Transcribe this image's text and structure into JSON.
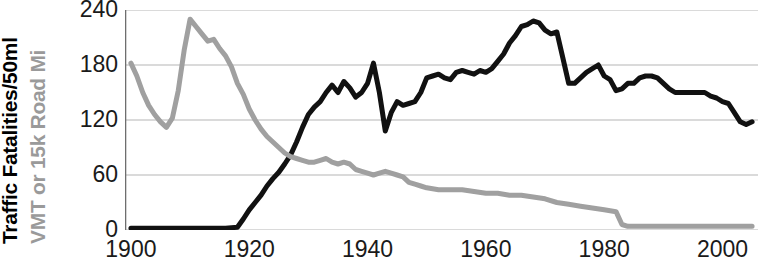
{
  "chart_data": {
    "type": "line",
    "title": "",
    "xlabel": "",
    "ylabel_primary": "Traffic Fatalities/50ml",
    "ylabel_secondary": "VMT or 15k Road Mi",
    "xlim": [
      1899,
      2006
    ],
    "ylim": [
      0,
      240
    ],
    "xticks": [
      1900,
      1920,
      1940,
      1960,
      1980,
      2000
    ],
    "xtick_labels": [
      "1900",
      "1920",
      "1940",
      "1960",
      "1980",
      "2000"
    ],
    "yticks": [
      0,
      60,
      120,
      180,
      240
    ],
    "ytick_labels": [
      "0",
      "60",
      "120",
      "180",
      "240"
    ],
    "grid": true,
    "grid_axis": "y",
    "legend": "none",
    "colors": {
      "series_black": "#111111",
      "series_gray": "#a0a0a0",
      "grid": "#b5b5b5",
      "axis": "#6e6e6e",
      "text": "#1a1a1a"
    },
    "series": [
      {
        "name": "Traffic Fatalities per 50 million VMT",
        "color": "#111111",
        "linewidth": 5,
        "x": [
          1900,
          1902,
          1904,
          1906,
          1908,
          1910,
          1912,
          1914,
          1916,
          1918,
          1919,
          1920,
          1921,
          1922,
          1923,
          1924,
          1925,
          1926,
          1927,
          1928,
          1929,
          1930,
          1931,
          1932,
          1933,
          1934,
          1935,
          1936,
          1937,
          1938,
          1939,
          1940,
          1941,
          1942,
          1943,
          1944,
          1945,
          1946,
          1947,
          1948,
          1949,
          1950,
          1951,
          1952,
          1953,
          1954,
          1955,
          1956,
          1957,
          1958,
          1959,
          1960,
          1961,
          1962,
          1963,
          1964,
          1965,
          1966,
          1967,
          1968,
          1969,
          1970,
          1971,
          1972,
          1973,
          1974,
          1975,
          1976,
          1977,
          1978,
          1979,
          1980,
          1981,
          1982,
          1983,
          1984,
          1985,
          1986,
          1987,
          1988,
          1989,
          1990,
          1991,
          1992,
          1993,
          1994,
          1995,
          1996,
          1997,
          1998,
          1999,
          2000,
          2001,
          2002,
          2003,
          2004,
          2005
        ],
        "values": [
          2,
          2,
          2,
          2,
          2,
          2,
          2,
          2,
          2,
          3,
          12,
          22,
          30,
          38,
          48,
          56,
          63,
          72,
          82,
          96,
          112,
          126,
          134,
          140,
          150,
          158,
          150,
          162,
          155,
          145,
          150,
          160,
          182,
          150,
          108,
          128,
          140,
          136,
          138,
          140,
          150,
          166,
          168,
          170,
          166,
          164,
          172,
          174,
          172,
          170,
          174,
          172,
          176,
          184,
          192,
          204,
          212,
          222,
          224,
          228,
          226,
          218,
          214,
          216,
          188,
          160,
          160,
          166,
          172,
          176,
          180,
          168,
          164,
          152,
          154,
          160,
          160,
          166,
          168,
          168,
          166,
          160,
          154,
          150,
          150,
          150,
          150,
          150,
          150,
          146,
          144,
          140,
          138,
          128,
          118,
          115,
          118
        ]
      },
      {
        "name": "VMT or 15k Road Miles",
        "color": "#a0a0a0",
        "linewidth": 5,
        "x": [
          1900,
          1901,
          1902,
          1903,
          1904,
          1905,
          1906,
          1907,
          1908,
          1909,
          1910,
          1911,
          1912,
          1913,
          1914,
          1915,
          1916,
          1917,
          1918,
          1919,
          1920,
          1921,
          1922,
          1923,
          1924,
          1925,
          1926,
          1927,
          1928,
          1929,
          1930,
          1931,
          1932,
          1933,
          1934,
          1935,
          1936,
          1937,
          1938,
          1939,
          1940,
          1941,
          1942,
          1943,
          1944,
          1945,
          1946,
          1947,
          1948,
          1949,
          1950,
          1952,
          1954,
          1956,
          1958,
          1960,
          1962,
          1964,
          1966,
          1968,
          1970,
          1972,
          1974,
          1976,
          1978,
          1980,
          1982,
          1983,
          1984,
          1986,
          1988,
          1990,
          1992,
          1994,
          1996,
          1998,
          2000,
          2002,
          2004,
          2005
        ],
        "values": [
          182,
          168,
          150,
          136,
          126,
          118,
          112,
          122,
          152,
          196,
          230,
          222,
          214,
          206,
          208,
          198,
          190,
          178,
          160,
          148,
          132,
          120,
          110,
          102,
          96,
          90,
          84,
          80,
          78,
          76,
          74,
          74,
          76,
          78,
          74,
          72,
          74,
          72,
          66,
          64,
          62,
          60,
          62,
          64,
          62,
          60,
          58,
          52,
          50,
          48,
          46,
          44,
          44,
          44,
          42,
          40,
          40,
          38,
          38,
          36,
          34,
          30,
          28,
          26,
          24,
          22,
          20,
          6,
          4,
          4,
          4,
          4,
          4,
          4,
          4,
          4,
          4,
          4,
          4,
          4
        ]
      }
    ]
  }
}
